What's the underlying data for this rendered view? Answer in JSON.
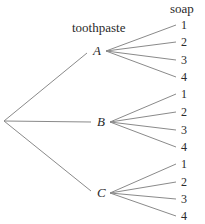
{
  "diagram": {
    "type": "tree",
    "headers": {
      "level1": "toothpaste",
      "level2": "soap"
    },
    "root": {
      "x": 4,
      "y": 121
    },
    "nodes": [
      {
        "label": "A",
        "x": 93,
        "y": 51,
        "leaves": [
          {
            "label": "1",
            "y": 25
          },
          {
            "label": "2",
            "y": 42
          },
          {
            "label": "3",
            "y": 60
          },
          {
            "label": "4",
            "y": 77
          }
        ]
      },
      {
        "label": "B",
        "x": 97,
        "y": 122,
        "leaves": [
          {
            "label": "1",
            "y": 94
          },
          {
            "label": "2",
            "y": 112
          },
          {
            "label": "3",
            "y": 130
          },
          {
            "label": "4",
            "y": 147
          }
        ]
      },
      {
        "label": "C",
        "x": 97,
        "y": 193,
        "leaves": [
          {
            "label": "1",
            "y": 164
          },
          {
            "label": "2",
            "y": 182
          },
          {
            "label": "3",
            "y": 199
          },
          {
            "label": "4",
            "y": 216
          }
        ]
      }
    ],
    "style": {
      "line_color": "#8a8a8a",
      "text_color": "#2a2a2a"
    }
  }
}
